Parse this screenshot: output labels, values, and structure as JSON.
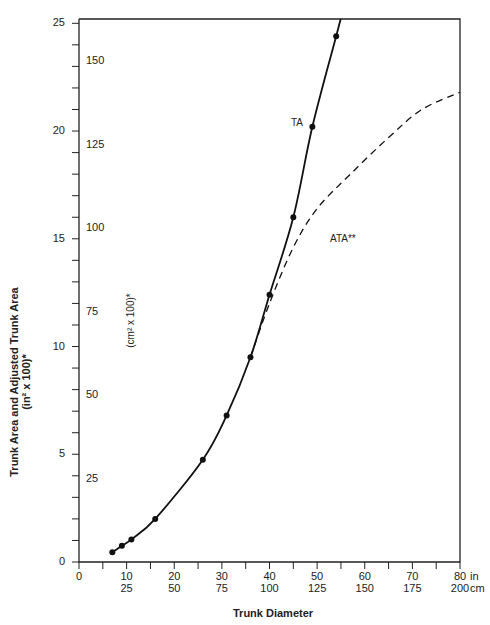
{
  "chart_data": {
    "type": "line",
    "title": "",
    "xlabel": "Trunk Diameter",
    "ylabel": "Trunk Area and Adjusted Trunk Area",
    "ylabel_units": "(in² x 100)*",
    "ylabel_secondary": "(cm² x 100)*",
    "xlim": [
      0,
      80
    ],
    "ylim": [
      0,
      25
    ],
    "x_ticks_in": [
      "0",
      "10",
      "20",
      "30",
      "40",
      "50",
      "60",
      "70",
      "80"
    ],
    "x_ticks_cm": [
      "",
      "25",
      "50",
      "75",
      "100",
      "125",
      "150",
      "175",
      "200"
    ],
    "x_unit_in": "in",
    "x_unit_cm": "cm",
    "y_ticks_in": [
      "0",
      "5",
      "10",
      "15",
      "20",
      "25"
    ],
    "y_ticks_cm": [
      "25",
      "50",
      "75",
      "100",
      "125",
      "150"
    ],
    "grid": false,
    "series": [
      {
        "name": "TA",
        "style": "solid",
        "markers": true,
        "x": [
          7,
          9,
          11,
          16,
          26,
          31,
          36,
          40,
          45,
          49,
          54
        ],
        "y": [
          0.45,
          0.75,
          1.05,
          2.0,
          4.75,
          6.8,
          9.5,
          12.4,
          16.0,
          20.2,
          24.4
        ]
      },
      {
        "name": "ATA**",
        "style": "dashed",
        "markers": false,
        "x": [
          36,
          40,
          45,
          50,
          57,
          65,
          72,
          80
        ],
        "y": [
          9.5,
          12.0,
          14.6,
          16.4,
          18.0,
          19.7,
          21.0,
          21.8
        ]
      }
    ]
  },
  "labels": {
    "ylabel_line1": "Trunk Area and Adjusted Trunk Area",
    "ylabel_line2": "(in² x 100)*",
    "ylabel_cm": "(cm² x 100)*",
    "xlabel": "Trunk Diameter",
    "ta": "TA",
    "ata": "ATA**",
    "unit_in": "in",
    "unit_cm": "cm"
  }
}
